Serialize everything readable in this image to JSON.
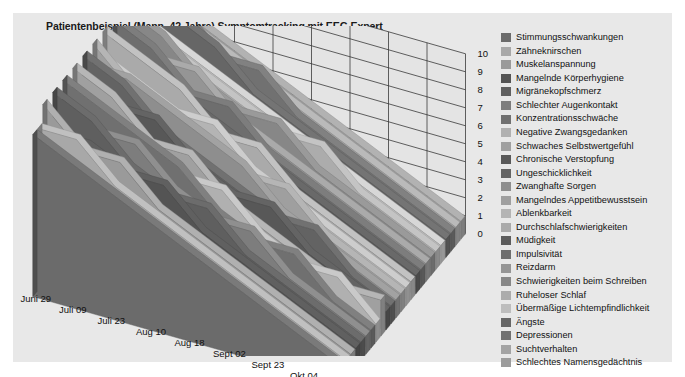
{
  "chart_title": "Patientenbeispiel (Mann, 42 Jahre) Symptomtracking mit EEG Expert",
  "chart_data": {
    "type": "area",
    "title": "Patientenbeispiel (Mann, 42 Jahre) Symptomtracking mit EEG Expert",
    "xlabel": "",
    "ylabel": "",
    "zlim": [
      0,
      10
    ],
    "grid": true,
    "legend_position": "right",
    "projection": "3d-ribbon",
    "categories": [
      "Juni 29",
      "Juli 09",
      "Juli 23",
      "Aug 10",
      "Aug 18",
      "Sept 02",
      "Sept 23",
      "Okt 04",
      "Okt 28"
    ],
    "zticks": [
      "10",
      "9",
      "8",
      "7",
      "6",
      "5",
      "4",
      "3",
      "2",
      "1",
      "0"
    ],
    "series": [
      {
        "name": "Stimmungsschwankungen",
        "color": "#6b6b6b",
        "values": [
          9,
          8,
          7,
          6,
          5,
          4,
          3,
          2,
          1
        ]
      },
      {
        "name": "Zähneknirschen",
        "color": "#a8a8a8",
        "values": [
          9,
          9,
          7,
          6,
          5,
          4,
          3,
          2,
          1
        ]
      },
      {
        "name": "Muskelanspannung",
        "color": "#9a9a9a",
        "values": [
          10,
          8,
          8,
          6,
          5,
          4,
          3,
          2,
          1
        ]
      },
      {
        "name": "Mangelnde Körperhygiene",
        "color": "#545454",
        "values": [
          8,
          8,
          7,
          7,
          5,
          4,
          3,
          2,
          1
        ]
      },
      {
        "name": "Migränekopfschmerz",
        "color": "#5f5f5f",
        "values": [
          10,
          9,
          7,
          6,
          6,
          4,
          3,
          2,
          1
        ]
      },
      {
        "name": "Schlechter Augenkontakt",
        "color": "#7d7d7d",
        "values": [
          9,
          8,
          8,
          6,
          5,
          5,
          3,
          2,
          1
        ]
      },
      {
        "name": "Konzentrationsschwäche",
        "color": "#707070",
        "values": [
          10,
          9,
          8,
          7,
          5,
          4,
          4,
          2,
          1
        ]
      },
      {
        "name": "Negative Zwangsgedanken",
        "color": "#b0b0b0",
        "values": [
          9,
          8,
          7,
          6,
          6,
          4,
          3,
          3,
          1
        ]
      },
      {
        "name": "Schwaches Selbstwertgefühl",
        "color": "#a0a0a0",
        "values": [
          10,
          9,
          7,
          7,
          5,
          4,
          3,
          2,
          2
        ]
      },
      {
        "name": "Chronische Verstopfung",
        "color": "#585858",
        "values": [
          9,
          8,
          8,
          6,
          5,
          5,
          3,
          2,
          1
        ]
      },
      {
        "name": "Ungeschicklichkeit",
        "color": "#636363",
        "values": [
          10,
          9,
          7,
          6,
          5,
          4,
          4,
          2,
          1
        ]
      },
      {
        "name": "Zwanghafte Sorgen",
        "color": "#8e8e8e",
        "values": [
          9,
          9,
          8,
          7,
          6,
          4,
          3,
          2,
          1
        ]
      },
      {
        "name": "Mangelndes Appetitbewusstsein",
        "color": "#9f9f9f",
        "values": [
          10,
          8,
          7,
          6,
          5,
          5,
          3,
          2,
          1
        ]
      },
      {
        "name": "Ablenkbarkeit",
        "color": "#b4b4b4",
        "values": [
          9,
          8,
          7,
          7,
          5,
          4,
          3,
          2,
          1
        ]
      },
      {
        "name": "Durchschlafschwierigkeiten",
        "color": "#aaaaaa",
        "values": [
          10,
          9,
          8,
          6,
          6,
          4,
          3,
          2,
          1
        ]
      },
      {
        "name": "Müdigkeit",
        "color": "#5c5c5c",
        "values": [
          9,
          8,
          7,
          6,
          5,
          4,
          3,
          2,
          1
        ]
      },
      {
        "name": "Impulsivität",
        "color": "#6e6e6e",
        "values": [
          10,
          9,
          7,
          7,
          5,
          4,
          3,
          2,
          1
        ]
      },
      {
        "name": "Reizdarm",
        "color": "#959595",
        "values": [
          9,
          8,
          8,
          6,
          5,
          4,
          3,
          2,
          1
        ]
      },
      {
        "name": "Schwierigkeiten beim Schreiben",
        "color": "#878787",
        "values": [
          10,
          9,
          7,
          6,
          6,
          4,
          3,
          2,
          1
        ]
      },
      {
        "name": "Ruheloser Schlaf",
        "color": "#acacac",
        "values": [
          9,
          8,
          7,
          6,
          5,
          5,
          3,
          2,
          1
        ]
      },
      {
        "name": "Übermäßige Lichtempfindlichkeit",
        "color": "#bdbdbd",
        "values": [
          9,
          8,
          7,
          6,
          5,
          4,
          3,
          2,
          1
        ]
      },
      {
        "name": "Ängste",
        "color": "#666666",
        "values": [
          10,
          9,
          8,
          6,
          5,
          4,
          3,
          2,
          1
        ]
      },
      {
        "name": "Depressionen",
        "color": "#717171",
        "values": [
          9,
          9,
          7,
          7,
          5,
          4,
          3,
          2,
          1
        ]
      },
      {
        "name": "Suchtverhalten",
        "color": "#a3a3a3",
        "values": [
          10,
          8,
          7,
          6,
          5,
          4,
          3,
          2,
          1
        ]
      },
      {
        "name": "Schlechtes Namensgedächtnis",
        "color": "#9c9c9c",
        "values": [
          9,
          8,
          7,
          6,
          5,
          4,
          3,
          2,
          1
        ]
      }
    ]
  }
}
